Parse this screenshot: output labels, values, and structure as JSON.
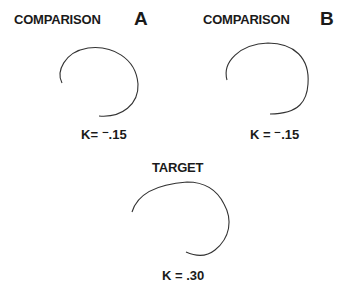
{
  "panels": {
    "a": {
      "title": "COMPARISON",
      "letter": "A",
      "k_label": "K= ⁻.15"
    },
    "b": {
      "title": "COMPARISON",
      "letter": "B",
      "k_label": "K = ⁻.15"
    },
    "target": {
      "title": "TARGET",
      "k_label": "K = .30"
    }
  },
  "colors": {
    "stroke": "#333333",
    "text": "#1a1a1a"
  }
}
